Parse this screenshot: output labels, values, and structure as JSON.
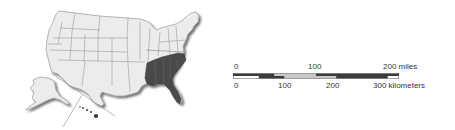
{
  "map": {
    "title": "United States map with highlighted Southeastern states",
    "highlighted_region": "Southeast",
    "highlighted_states": [
      "Tennessee",
      "Mississippi",
      "Alabama",
      "Georgia",
      "Florida",
      "South Carolina",
      "North Carolina"
    ],
    "colors": {
      "highlight": "#4a4a4a",
      "land": "#ececec",
      "border": "#8a8a8a",
      "shadow": "#3a3a3a"
    },
    "insets": [
      "Alaska",
      "Hawaii"
    ]
  },
  "scale": {
    "miles": {
      "labels": [
        "0",
        "100",
        "200 miles"
      ],
      "values": [
        0,
        100,
        200
      ],
      "segments": [
        {
          "from": 0,
          "to": 50,
          "shade": "dark"
        },
        {
          "from": 50,
          "to": 100,
          "shade": "light"
        },
        {
          "from": 100,
          "to": 200,
          "shade": "dark"
        }
      ]
    },
    "kilometers": {
      "labels": [
        "0",
        "100",
        "200",
        "300 kilometers"
      ],
      "values": [
        0,
        100,
        200,
        300
      ],
      "segments": [
        {
          "from": 0,
          "to": 50,
          "shade": "white"
        },
        {
          "from": 50,
          "to": 100,
          "shade": "dark"
        },
        {
          "from": 100,
          "to": 200,
          "shade": "light"
        },
        {
          "from": 200,
          "to": 300,
          "shade": "dark"
        }
      ]
    },
    "colors": {
      "dark": "#3c3c3c",
      "light": "#c8c8c8",
      "white": "#ffffff",
      "outline": "#555555"
    }
  }
}
